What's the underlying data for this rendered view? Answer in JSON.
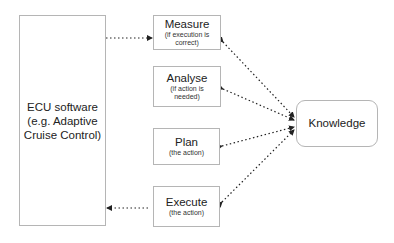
{
  "ecu": {
    "lines": [
      "ECU software",
      "(e.g. Adaptive",
      "Cruise Control)"
    ]
  },
  "steps": [
    {
      "title": "Measure",
      "sub_lines": [
        "(if execution is",
        "correct)"
      ]
    },
    {
      "title": "Analyse",
      "sub_lines": [
        "(if action is",
        "needed)"
      ]
    },
    {
      "title": "Plan",
      "sub_lines": [
        "(the action)"
      ]
    },
    {
      "title": "Execute",
      "sub_lines": [
        "(the action)"
      ]
    }
  ],
  "knowledge": {
    "label": "Knowledge"
  },
  "colors": {
    "border": "#b5b5b5",
    "arrow": "#222222",
    "text": "#222222"
  }
}
